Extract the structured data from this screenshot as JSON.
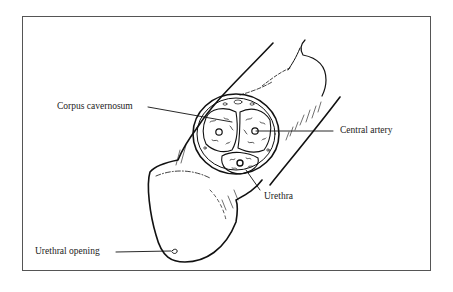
{
  "figure": {
    "type": "anatomical-illustration",
    "colors": {
      "line": "#111111",
      "frame": "#555555",
      "text": "#222222",
      "background": "#ffffff"
    }
  },
  "labels": {
    "corpus_cavernosum": "Corpus cavernosum",
    "central_artery": "Central artery",
    "urethra": "Urethra",
    "urethral_opening": "Urethral opening"
  }
}
